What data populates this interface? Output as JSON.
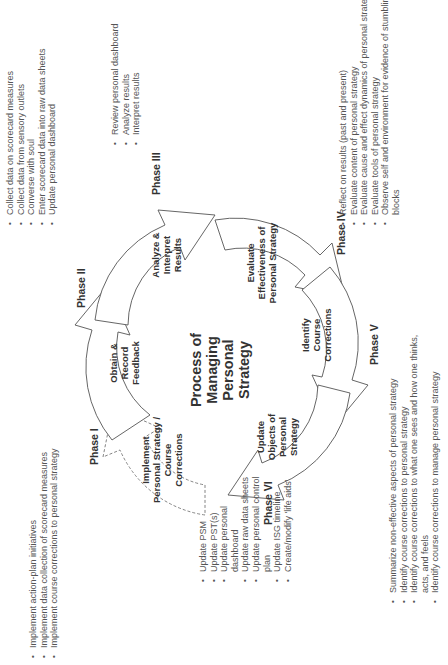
{
  "center": {
    "title_lines": [
      "Process of",
      "Managing",
      "Personal",
      "Strategy"
    ]
  },
  "phases": [
    {
      "id": "I",
      "label": "Phase I",
      "arrow_label": [
        "Implement",
        "Personal Strategy /",
        "Course",
        "Corrections"
      ],
      "arrow_style": "dashed",
      "bullets": [
        "Implement action-plan initiatives",
        "Implement data collection of scorecard measures",
        "Implement course corrections to personal strategy"
      ]
    },
    {
      "id": "II",
      "label": "Phase II",
      "arrow_label": [
        "Obtain &",
        "Record",
        "Feedback"
      ],
      "arrow_style": "solid",
      "bullets": [
        "Collect data on scorecard measures",
        "Collect data from sensory outlets",
        "Converse with soul",
        "Enter scorecard data into raw data sheets",
        "Update personal dashboard"
      ]
    },
    {
      "id": "III",
      "label": "Phase III",
      "arrow_label": [
        "Analyze &",
        "Interpret",
        "Results"
      ],
      "arrow_style": "solid",
      "bullets": [
        "Review personal dashboard",
        "Analyze results",
        "Interpret results"
      ]
    },
    {
      "id": "IV",
      "label": "Phase IV",
      "arrow_label": [
        "Evaluate",
        "Effectiveness of",
        "Personal Strategy"
      ],
      "arrow_style": "solid",
      "bullets": [
        "Reflect on results (past and present)",
        "Evaluate content of personal strategy",
        "Evaluate cause and effect dynamics of personal strategy",
        "Evaluate tools of personal strategy",
        "Observe self and environment for evidence of stumbling blocks"
      ]
    },
    {
      "id": "V",
      "label": "Phase V",
      "arrow_label": [
        "Identify",
        "Course",
        "Corrections"
      ],
      "arrow_style": "solid",
      "bullets": [
        "Summarize non-effective aspects of personal strategy",
        "Identify course corrections to personal strategy",
        "Identify course corrections to what one sees and how one thinks, acts, and feels",
        "Identify course corrections to manage personal strategy"
      ]
    },
    {
      "id": "VI",
      "label": "Phase VI",
      "arrow_label": [
        "Update",
        "Objects of",
        "Personal",
        "Strategy"
      ],
      "arrow_style": "solid",
      "bullets": [
        "Update PSM",
        "Update PST(s)",
        "Update personal dashboard",
        "Update raw data sheets",
        "Update personal control plan",
        "Update ISG timeline",
        "Create/modify 'life aids'"
      ]
    }
  ]
}
